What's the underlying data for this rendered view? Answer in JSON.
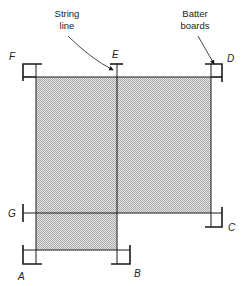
{
  "figure": {
    "annotations": {
      "string_line": [
        "String",
        "line"
      ],
      "batter_boards": [
        "Batter",
        "boards"
      ]
    },
    "points": {
      "A": "A",
      "B": "B",
      "C": "C",
      "D": "D",
      "E": "E",
      "F": "F",
      "G": "G"
    },
    "colors": {
      "line": "#1a1a1a",
      "shade": "#c8c8c8",
      "background": "#ffffff"
    }
  }
}
